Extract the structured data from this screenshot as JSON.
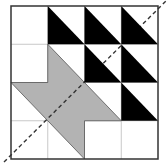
{
  "diagram": {
    "type": "grid-tiling",
    "grid": {
      "cols": 4,
      "rows": 4,
      "origin": [
        11,
        6
      ],
      "cell_w": 36.75,
      "cell_h": 38.25
    },
    "colors": {
      "background": "#ffffff",
      "black": "#000000",
      "gray": "#b3b3b3",
      "grid_line": "#c8c8c8",
      "outline": "#333333",
      "dashed": "#333333"
    },
    "black_triangles": [
      {
        "col": 1,
        "row": 0,
        "half": "lower-left"
      },
      {
        "col": 2,
        "row": 0,
        "half": "lower-left"
      },
      {
        "col": 3,
        "row": 0,
        "half": "lower-left"
      },
      {
        "col": 2,
        "row": 1,
        "half": "lower-left"
      },
      {
        "col": 3,
        "row": 1,
        "half": "lower-left"
      },
      {
        "col": 3,
        "row": 2,
        "half": "lower-left"
      }
    ],
    "gray_polygon": [
      [
        1,
        1
      ],
      [
        3,
        3
      ],
      [
        2,
        3
      ],
      [
        2,
        4
      ],
      [
        1,
        3
      ],
      [
        0,
        2
      ],
      [
        1,
        2
      ]
    ],
    "diagonal": {
      "from": [
        4,
        162
      ],
      "to": [
        166,
        1
      ],
      "style": "dashed"
    }
  }
}
